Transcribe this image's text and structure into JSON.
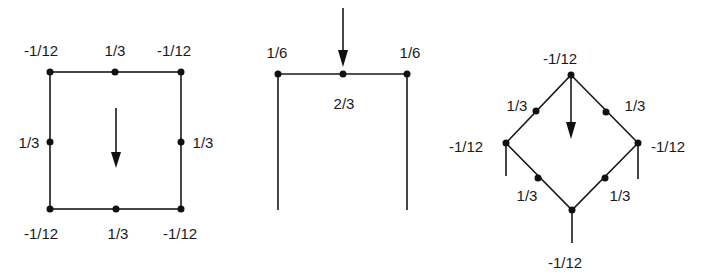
{
  "figures": [
    {
      "name": "square-element",
      "labels": {
        "top_left": "-1/12",
        "top_mid": "1/3",
        "top_right": "-1/12",
        "left_mid": "1/3",
        "right_mid": "1/3",
        "bottom_left": "-1/12",
        "bottom_mid": "1/3",
        "bottom_right": "-1/12"
      },
      "load": "downward-arrow-center"
    },
    {
      "name": "open-frame-element",
      "labels": {
        "top_left": "1/6",
        "top_right": "1/6",
        "top_mid": "2/3"
      },
      "load": "downward-arrow-top-mid"
    },
    {
      "name": "diamond-element",
      "labels": {
        "top": "-1/12",
        "upper_left_mid": "1/3",
        "upper_right_mid": "1/3",
        "left": "-1/12",
        "right": "-1/12",
        "lower_left_mid": "1/3",
        "lower_right_mid": "1/3",
        "bottom": "-1/12"
      },
      "load": "downward-arrow-from-top"
    }
  ],
  "colors": {
    "ink": "#1a1a1a",
    "background": "#ffffff"
  }
}
